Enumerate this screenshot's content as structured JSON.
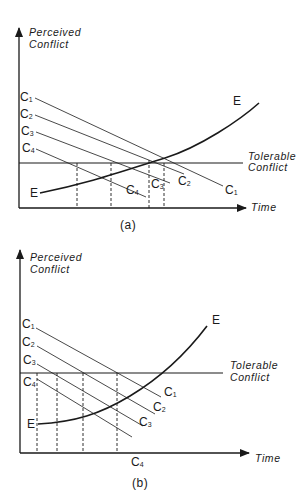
{
  "panels": [
    {
      "id": "a",
      "caption": "(a)",
      "y_axis_label": [
        "Perceived",
        "Conflict"
      ],
      "x_axis_label": "Time",
      "threshold_label": [
        "Tolerable",
        "Conflict"
      ],
      "curve_label_start": "E",
      "curve_label_end": "E",
      "lines": [
        {
          "name": "C",
          "sub": "1",
          "start_label": "C1",
          "end_label": "C1"
        },
        {
          "name": "C",
          "sub": "2",
          "start_label": "C2",
          "end_label": "C2"
        },
        {
          "name": "C",
          "sub": "3",
          "start_label": "C3",
          "end_label": "C3"
        },
        {
          "name": "C",
          "sub": "4",
          "start_label": "C4",
          "end_label": "C4"
        }
      ]
    },
    {
      "id": "b",
      "caption": "(b)",
      "y_axis_label": [
        "Perceived",
        "Conflict"
      ],
      "x_axis_label": "Time",
      "threshold_label": [
        "Tolerable",
        "Conflict"
      ],
      "curve_label_start": "E",
      "curve_label_end": "E",
      "lines": [
        {
          "name": "C",
          "sub": "1",
          "start_label": "C1",
          "end_label": "C1"
        },
        {
          "name": "C",
          "sub": "2",
          "start_label": "C2",
          "end_label": "C2"
        },
        {
          "name": "C",
          "sub": "3",
          "start_label": "C3",
          "end_label": "C3"
        },
        {
          "name": "C",
          "sub": "4",
          "start_label": "C4",
          "end_label": "C4"
        }
      ]
    }
  ],
  "colors": {
    "ink": "#1a1a1a",
    "background": "#ffffff"
  }
}
